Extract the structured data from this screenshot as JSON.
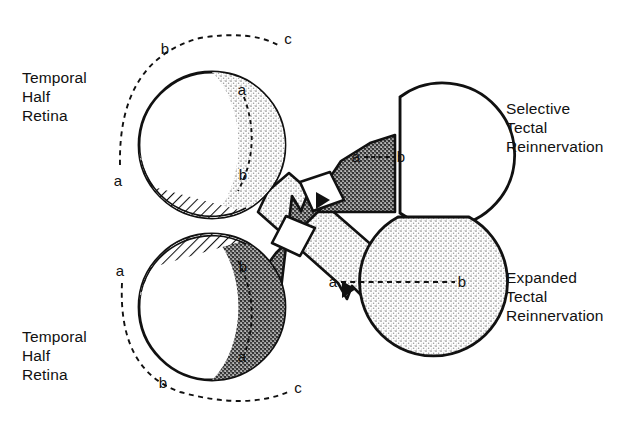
{
  "figure": {
    "type": "diagram",
    "background_color": "#ffffff",
    "ink_color": "#111111",
    "stipple_light_color": "#d9d9d9",
    "stipple_dark_color": "#555555"
  },
  "captions": {
    "top_left": "Temporal\nHalf\nRetina",
    "bottom_left": "Temporal\nHalf\nRetina",
    "top_right": "Selective\nTectal\nReinnervation",
    "bottom_right": "Expanded\nTectal\nReinnervation"
  },
  "retinas": [
    {
      "id": "upper-retina",
      "position": "top-left",
      "crescent_fill": "light-stipple",
      "hatched_sector": "lower-left",
      "inner_arc_labels": {
        "top": "a",
        "bottom": "b"
      },
      "outer_arc_labels": {
        "start": "a",
        "middle": "b",
        "end": "c"
      }
    },
    {
      "id": "lower-retina",
      "position": "bottom-left",
      "crescent_fill": "dark-stipple",
      "hatched_sector": "upper-left",
      "inner_arc_labels": {
        "top": "b",
        "bottom": "a"
      },
      "outer_arc_labels": {
        "start": "a",
        "middle": "b",
        "end": "c"
      }
    }
  ],
  "tecta": [
    {
      "id": "upper-tectum",
      "position": "top-right",
      "label_group": "Selective Tectal Reinnervation",
      "fill_left": "dark-stipple",
      "fill_right": "white",
      "innervated_fraction": 0.45,
      "axis_label_left": "a",
      "axis_label_right": "b",
      "axis_dashes": 5
    },
    {
      "id": "lower-tectum",
      "position": "bottom-right",
      "label_group": "Expanded Tectal Reinnervation",
      "fill_left": "light-stipple",
      "fill_right": "light-stipple",
      "innervated_fraction": 1.0,
      "axis_label_left": "a",
      "axis_label_right": "b",
      "axis_dashes": 13
    }
  ],
  "optic_nerves": [
    {
      "id": "upper-nerve",
      "from": "upper-retina",
      "to": "lower-tectum",
      "fill": "light-stipple",
      "crosses": true
    },
    {
      "id": "lower-nerve",
      "from": "lower-retina",
      "to": "upper-tectum",
      "fill": "dark-stipple",
      "crosses": true
    }
  ],
  "marks": {
    "upper_retina_inner_a": "a",
    "upper_retina_inner_b": "b",
    "upper_retina_outer_a": "a",
    "upper_retina_outer_b": "b",
    "upper_retina_outer_c": "c",
    "lower_retina_inner_b": "b",
    "lower_retina_inner_a": "a",
    "lower_retina_outer_a": "a",
    "lower_retina_outer_b": "b",
    "lower_retina_outer_c": "c",
    "upper_tectum_a": "a",
    "upper_tectum_b": "b",
    "lower_tectum_a": "a",
    "lower_tectum_b": "b"
  }
}
